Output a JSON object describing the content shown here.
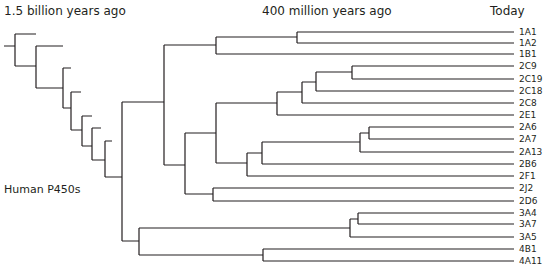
{
  "header": {
    "left_time": "1.5 billion years ago",
    "mid_time": "400 million years ago",
    "right_time": "Today"
  },
  "side_label": "Human P450s",
  "colors": {
    "line": "#231f20",
    "background": "#ffffff"
  },
  "leaves": [
    {
      "name": "1A1",
      "y": 32
    },
    {
      "name": "1A2",
      "y": 43
    },
    {
      "name": "1B1",
      "y": 54
    },
    {
      "name": "2C9",
      "y": 66
    },
    {
      "name": "2C19",
      "y": 79
    },
    {
      "name": "2C18",
      "y": 91
    },
    {
      "name": "2C8",
      "y": 103
    },
    {
      "name": "2E1",
      "y": 115
    },
    {
      "name": "2A6",
      "y": 127
    },
    {
      "name": "2A7",
      "y": 139
    },
    {
      "name": "2A13",
      "y": 152
    },
    {
      "name": "2B6",
      "y": 164
    },
    {
      "name": "2F1",
      "y": 176
    },
    {
      "name": "2J2",
      "y": 188
    },
    {
      "name": "2D6",
      "y": 201
    },
    {
      "name": "3A4",
      "y": 213
    },
    {
      "name": "3A7",
      "y": 224
    },
    {
      "name": "3A5",
      "y": 237
    },
    {
      "name": "4B1",
      "y": 249
    },
    {
      "name": "4A11",
      "y": 261
    }
  ]
}
